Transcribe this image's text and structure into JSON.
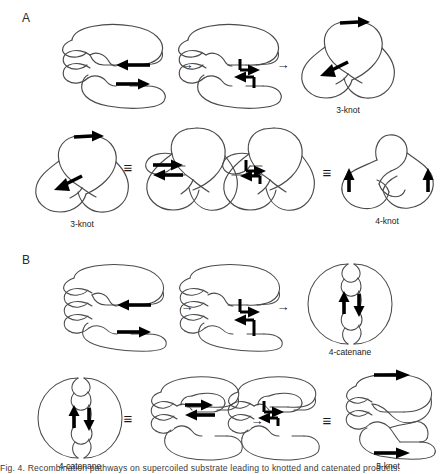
{
  "figure": {
    "background_color": "#ffffff",
    "stroke_color": "#4a4a4a",
    "arrow_color": "#000000",
    "width": 445,
    "height": 474
  },
  "panels": [
    {
      "id": "A",
      "label": "A",
      "rows": [
        {
          "id": "A-row1",
          "items": [
            {
              "kind": "structure",
              "name": "supercoiled-substrate-2-node",
              "label": "",
              "nodes": 2,
              "arrows": [
                "left",
                "right"
              ]
            },
            {
              "kind": "operator",
              "name": "reaction-arrow",
              "symbol": "→"
            },
            {
              "kind": "structure",
              "name": "synapse-complex-2-node",
              "label": "",
              "nodes": 2,
              "arrows": [
                "synapse"
              ]
            },
            {
              "kind": "operator",
              "name": "reaction-arrow",
              "symbol": "→"
            },
            {
              "kind": "structure",
              "name": "trefoil-knot",
              "label": "3-knot",
              "nodes": 3,
              "arrows": [
                "right",
                "left"
              ]
            }
          ]
        },
        {
          "id": "A-row2",
          "items": [
            {
              "kind": "structure",
              "name": "trefoil-knot",
              "label": "3-knot",
              "nodes": 3,
              "arrows": [
                "right",
                "left"
              ]
            },
            {
              "kind": "operator",
              "name": "equivalence",
              "symbol": "≡"
            },
            {
              "kind": "structure",
              "name": "trefoil-knot-with-substrate-sites",
              "label": "",
              "nodes": 3,
              "arrows": [
                "right",
                "left"
              ]
            },
            {
              "kind": "operator",
              "name": "reaction-arrow",
              "symbol": "→"
            },
            {
              "kind": "structure",
              "name": "trefoil-synapse-complex",
              "label": "",
              "nodes": 3,
              "arrows": [
                "synapse"
              ]
            },
            {
              "kind": "operator",
              "name": "equivalence",
              "symbol": "≡"
            },
            {
              "kind": "structure",
              "name": "figure-eight-knot",
              "label": "4-knot",
              "nodes": 4,
              "arrows": [
                "up",
                "up"
              ]
            }
          ]
        }
      ]
    },
    {
      "id": "B",
      "label": "B",
      "rows": [
        {
          "id": "B-row1",
          "items": [
            {
              "kind": "structure",
              "name": "supercoiled-substrate-3-node",
              "label": "",
              "nodes": 3,
              "arrows": [
                "left",
                "right"
              ]
            },
            {
              "kind": "operator",
              "name": "reaction-arrow",
              "symbol": "→"
            },
            {
              "kind": "structure",
              "name": "synapse-complex-3-node",
              "label": "",
              "nodes": 3,
              "arrows": [
                "synapse"
              ]
            },
            {
              "kind": "operator",
              "name": "reaction-arrow",
              "symbol": "→"
            },
            {
              "kind": "structure",
              "name": "four-catenane",
              "label": "4-catenane",
              "nodes": 4,
              "arrows": [
                "up",
                "down"
              ]
            }
          ]
        },
        {
          "id": "B-row2",
          "items": [
            {
              "kind": "structure",
              "name": "four-catenane",
              "label": "4-catenane",
              "nodes": 4,
              "arrows": [
                "up",
                "down"
              ]
            },
            {
              "kind": "operator",
              "name": "equivalence",
              "symbol": "≡"
            },
            {
              "kind": "structure",
              "name": "four-catenane-with-substrate-sites",
              "label": "",
              "nodes": 4,
              "arrows": [
                "right",
                "left"
              ]
            },
            {
              "kind": "operator",
              "name": "reaction-arrow",
              "symbol": "→"
            },
            {
              "kind": "structure",
              "name": "catenane-synapse-complex",
              "label": "",
              "nodes": 4,
              "arrows": [
                "synapse"
              ]
            },
            {
              "kind": "operator",
              "name": "equivalence",
              "symbol": "≡"
            },
            {
              "kind": "structure",
              "name": "five-knot",
              "label": "5-knot",
              "nodes": 5,
              "arrows": [
                "right",
                "right"
              ]
            }
          ]
        }
      ]
    }
  ],
  "labels": {
    "panel_a": "A",
    "panel_b": "B",
    "three_knot": "3-knot",
    "four_knot": "4-knot",
    "four_catenane": "4-catenane",
    "five_knot": "5-knot",
    "reaction_arrow": "→",
    "equivalence": "≡"
  },
  "caption": {
    "text": "Fig. 4. Recombination pathways on supercoiled substrate leading to knotted and catenated products."
  }
}
